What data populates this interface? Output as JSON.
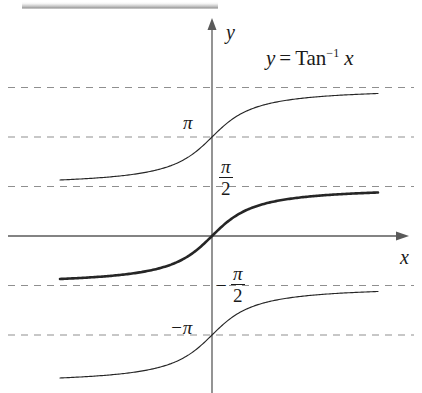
{
  "figure": {
    "equation_label": {
      "lhs": "y",
      "eq": "=",
      "fn": "Tan",
      "exponent": "−1",
      "arg": "x"
    },
    "axes": {
      "y_label": "y",
      "x_label": "x"
    },
    "tick_labels": {
      "pi": "π",
      "pi_over_2_num": "π",
      "pi_over_2_den": "2",
      "neg_pi_over_2_sign": "−",
      "neg_pi_over_2_num": "π",
      "neg_pi_over_2_den": "2",
      "neg_pi": "−π"
    },
    "colors": {
      "curve": "#262626",
      "axis": "#5a5a5a",
      "gridline": "#8f8f8f",
      "background": "#ffffff"
    }
  },
  "chart_data": {
    "type": "line",
    "xlabel": "x",
    "ylabel": "y",
    "xlim": [
      -4.8,
      5.4
    ],
    "ylim": [
      -5.2,
      4.6
    ],
    "grid": true,
    "legend_position": "none",
    "gridlines_y": [
      4.712,
      3.142,
      1.571,
      -1.571,
      -3.142
    ],
    "gridline_labels": [
      "",
      "π",
      "π/2",
      "−π/2",
      "−π"
    ],
    "axis_lines": {
      "x_axis_y": 0,
      "y_axis_x": 0
    },
    "series": [
      {
        "name": "Tan⁻¹ x + π",
        "emphasis": "thin",
        "asymptotes": [
          1.571,
          4.712
        ],
        "x": [
          -4.8,
          -4.2,
          -3.6,
          -3.0,
          -2.4,
          -1.8,
          -1.2,
          -0.6,
          0.0,
          0.6,
          1.2,
          1.8,
          2.4,
          3.0,
          3.6,
          4.2,
          4.8,
          5.4
        ],
        "y": [
          1.777,
          1.808,
          1.845,
          1.893,
          1.965,
          2.083,
          2.266,
          2.601,
          3.142,
          3.682,
          4.017,
          4.2,
          4.318,
          4.391,
          4.438,
          4.475,
          4.506,
          4.96
        ]
      },
      {
        "name": "Tan⁻¹ x",
        "emphasis": "bold",
        "asymptotes": [
          -1.571,
          1.571
        ],
        "x": [
          -4.8,
          -4.2,
          -3.6,
          -3.0,
          -2.4,
          -1.8,
          -1.2,
          -0.6,
          0.0,
          0.6,
          1.2,
          1.8,
          2.4,
          3.0,
          3.6,
          4.2,
          4.8,
          5.4
        ],
        "y": [
          -1.365,
          -1.335,
          -1.297,
          -1.249,
          -1.176,
          -1.064,
          -0.876,
          -0.54,
          0.0,
          0.54,
          0.876,
          1.064,
          1.176,
          1.249,
          1.297,
          1.335,
          1.365,
          1.39
        ]
      },
      {
        "name": "Tan⁻¹ x − π",
        "emphasis": "thin",
        "asymptotes": [
          -4.712,
          -1.571
        ],
        "x": [
          -4.8,
          -4.2,
          -3.6,
          -3.0,
          -2.4,
          -1.8,
          -1.2,
          -0.6,
          0.0,
          0.6,
          1.2,
          1.8,
          2.4,
          3.0,
          3.6,
          4.2,
          4.8,
          5.4
        ],
        "y": [
          -4.506,
          -4.476,
          -4.438,
          -4.391,
          -4.318,
          -4.205,
          -4.017,
          -3.682,
          -3.142,
          -2.601,
          -2.266,
          -2.078,
          -1.965,
          -1.893,
          -1.845,
          -1.808,
          -1.777,
          -1.752
        ]
      }
    ]
  }
}
